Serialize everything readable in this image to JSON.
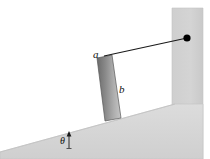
{
  "figure": {
    "type": "physics-diagram",
    "background_color": "#ffffff",
    "width": 210,
    "height": 159,
    "labels": {
      "string_segment": "a",
      "rod": "b",
      "incline_angle": "θ"
    },
    "colors": {
      "incline_fill": "#d6d6d6",
      "incline_edge": "#bdbdbd",
      "wall_fill": "#d0d0d0",
      "wall_edge": "#bdbdbd",
      "rod_dark": "#6b6b6b",
      "rod_light": "#c2c2c2",
      "rod_outline": "#4a4a4a",
      "string": "#1a1a1a",
      "pivot_dot": "#000000",
      "label_text": "#111111"
    },
    "geometry": {
      "pivot_point": {
        "x": 187,
        "y": 38
      },
      "rod_top": {
        "x": 101,
        "y": 57
      },
      "rod_bottom": {
        "x": 117,
        "y": 119
      },
      "string_length_label": "a",
      "rod_length_label": "b",
      "incline_angle_label": "θ",
      "incline_left_point": {
        "x": 0,
        "y": 152
      },
      "incline_right_point": {
        "x": 175,
        "y": 104
      },
      "wall_left": 172,
      "wall_right": 203,
      "wall_top": 8
    }
  }
}
